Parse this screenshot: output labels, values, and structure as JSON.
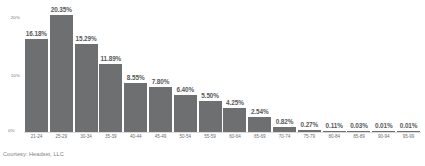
{
  "chart_data": {
    "type": "bar",
    "title": "",
    "subtitle": "",
    "xlabel": "",
    "ylabel": "",
    "ylim": [
      0,
      22
    ],
    "grid": false,
    "legend": null,
    "y_ticks": [
      "20%",
      "10%",
      "0%"
    ],
    "y_tick_values": [
      20,
      10,
      0
    ],
    "categories": [
      "21-24",
      "25-29",
      "30-34",
      "35-39",
      "40-44",
      "45-49",
      "50-54",
      "55-59",
      "60-64",
      "65-69",
      "70-74",
      "75-79",
      "80-84",
      "85-89",
      "90-94",
      "95-99"
    ],
    "values": [
      16.18,
      20.35,
      15.29,
      11.89,
      8.55,
      7.8,
      6.4,
      5.5,
      4.25,
      2.54,
      0.82,
      0.27,
      0.11,
      0.03,
      0.01,
      0.01
    ],
    "data_labels": [
      "16.18%",
      "20.35%",
      "15.29%",
      "11.89%",
      "8.55%",
      "7.80%",
      "6.40%",
      "5.50%",
      "4.25%",
      "2.54%",
      "0.82%",
      "0.27%",
      "0.11%",
      "0.03%",
      "0.01%",
      "0.01%"
    ],
    "bar_color": "#6e6f71",
    "label_color": "#58595b",
    "axis_text_color": "#6d6e71"
  },
  "footer": {
    "source": "Courtesy: Headset, LLC"
  }
}
